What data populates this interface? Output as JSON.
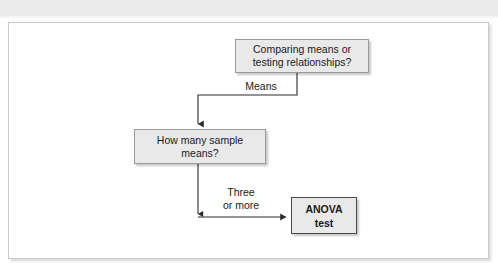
{
  "top_strip": {
    "fragment_text": "statistical test"
  },
  "figure": {
    "nodes": [
      {
        "id": "question-type",
        "label": "Comparing means or testing relationships?"
      },
      {
        "id": "sample-count",
        "label": "How many sample means?"
      },
      {
        "id": "anova-test",
        "label": "ANOVA\ntest"
      }
    ],
    "edge_labels": [
      {
        "id": "means",
        "text": "Means"
      },
      {
        "id": "three-or-more",
        "text": "Three\nor more"
      }
    ],
    "colors": {
      "box_fill": "#e9e9e9",
      "box_border": "#9a9a9a",
      "result_box_border": "#4a4a4a",
      "connector": "#2b2b2b",
      "frame_border": "#c9c9c9",
      "strip_background": "#ececec"
    }
  }
}
